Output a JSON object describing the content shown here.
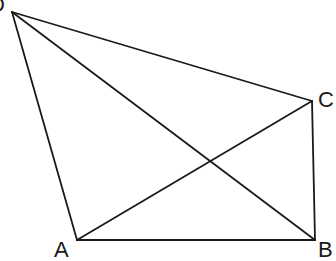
{
  "diagram": {
    "type": "geometry",
    "vertices": [
      {
        "id": "D",
        "label": "D",
        "x": 12,
        "y": 12,
        "label_x": -11,
        "label_y": 12
      },
      {
        "id": "C",
        "label": "C",
        "x": 312,
        "y": 101,
        "label_x": 318,
        "label_y": 107
      },
      {
        "id": "A",
        "label": "A",
        "x": 77,
        "y": 240,
        "label_x": 54,
        "label_y": 257
      },
      {
        "id": "B",
        "label": "B",
        "x": 315,
        "y": 240,
        "label_x": 318,
        "label_y": 257
      }
    ],
    "edges": [
      {
        "from": "D",
        "to": "A"
      },
      {
        "from": "D",
        "to": "C"
      },
      {
        "from": "D",
        "to": "B"
      },
      {
        "from": "A",
        "to": "B"
      },
      {
        "from": "A",
        "to": "C"
      },
      {
        "from": "C",
        "to": "B"
      }
    ],
    "intersection": {
      "of": [
        "AC",
        "DB"
      ],
      "x": 211,
      "y": 162
    },
    "line_color": "#1a1a1a",
    "background": "#ffffff"
  }
}
